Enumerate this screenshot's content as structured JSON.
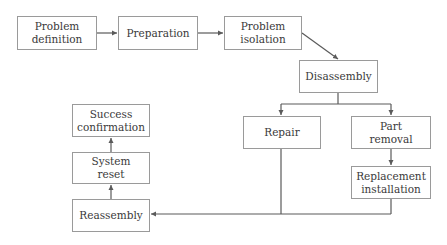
{
  "diagram": {
    "type": "flowchart",
    "colors": {
      "line": "#5a5a5a",
      "border": "#9a9a9a",
      "text": "#3a3a3a",
      "background": "#ffffff"
    },
    "nodes": [
      {
        "id": "problem_definition",
        "label": "Problem\ndefinition"
      },
      {
        "id": "preparation",
        "label": "Preparation"
      },
      {
        "id": "problem_isolation",
        "label": "Problem\nisolation"
      },
      {
        "id": "disassembly",
        "label": "Disassembly"
      },
      {
        "id": "repair",
        "label": "Repair"
      },
      {
        "id": "part_removal",
        "label": "Part\nremoval"
      },
      {
        "id": "replacement_installation",
        "label": "Replacement\ninstallation"
      },
      {
        "id": "reassembly",
        "label": "Reassembly"
      },
      {
        "id": "system_reset",
        "label": "System\nreset"
      },
      {
        "id": "success_confirmation",
        "label": "Success\nconfirmation"
      }
    ],
    "edges": [
      {
        "from": "problem_definition",
        "to": "preparation"
      },
      {
        "from": "preparation",
        "to": "problem_isolation"
      },
      {
        "from": "problem_isolation",
        "to": "disassembly"
      },
      {
        "from": "disassembly",
        "to": "repair"
      },
      {
        "from": "disassembly",
        "to": "part_removal"
      },
      {
        "from": "part_removal",
        "to": "replacement_installation"
      },
      {
        "from": "repair",
        "to": "reassembly"
      },
      {
        "from": "replacement_installation",
        "to": "reassembly"
      },
      {
        "from": "reassembly",
        "to": "system_reset"
      },
      {
        "from": "system_reset",
        "to": "success_confirmation"
      }
    ]
  }
}
